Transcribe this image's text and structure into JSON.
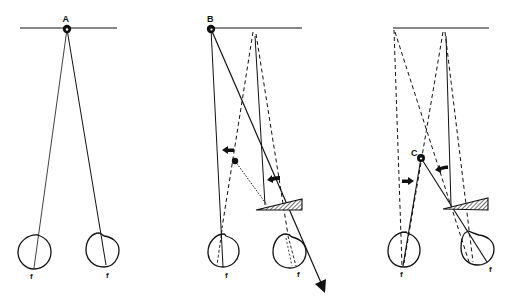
{
  "figure": {
    "panels": [
      {
        "id": "A",
        "label": "A",
        "fovea_labels": [
          "f",
          "f"
        ]
      },
      {
        "id": "B",
        "label": "B",
        "fovea_labels": [
          "f",
          "f"
        ]
      },
      {
        "id": "C",
        "label": "C",
        "fovea_labels": [
          "f",
          "f"
        ]
      }
    ],
    "colors": {
      "ink": "#111111",
      "background": "#ffffff"
    }
  }
}
